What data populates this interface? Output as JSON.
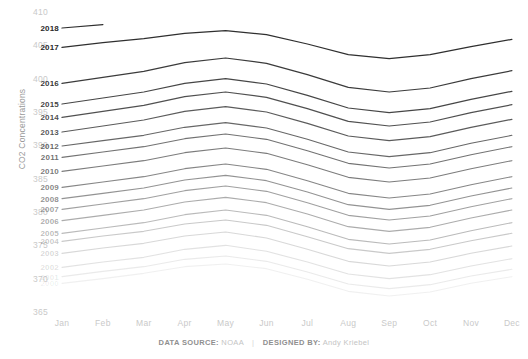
{
  "chart_data": {
    "type": "line",
    "title": "",
    "subtitle": "",
    "xlabel": "",
    "ylabel": "CO2 Concentrations",
    "grid": false,
    "legend_position": "inline-left-labels",
    "ylim": [
      365,
      410
    ],
    "y_ticks": [
      410,
      405,
      400,
      395,
      390,
      385,
      380,
      375,
      370,
      365
    ],
    "categories": [
      "Jan",
      "Feb",
      "Mar",
      "Apr",
      "May",
      "Jun",
      "Jul",
      "Aug",
      "Sep",
      "Oct",
      "Nov",
      "Dec"
    ],
    "x": [
      "Jan",
      "Feb",
      "Mar",
      "Apr",
      "May",
      "Jun",
      "Jul",
      "Aug",
      "Sep",
      "Oct",
      "Nov",
      "Dec"
    ],
    "series": [
      {
        "name": "2000",
        "opacity": 0.07,
        "values": [
          369.3,
          370.0,
          370.8,
          371.8,
          372.2,
          371.5,
          369.9,
          368.1,
          367.4,
          368.0,
          369.3,
          370.3
        ]
      },
      {
        "name": "2001",
        "opacity": 0.1,
        "values": [
          370.3,
          371.1,
          371.8,
          372.9,
          373.4,
          372.6,
          371.0,
          369.2,
          368.5,
          369.1,
          370.4,
          371.4
        ]
      },
      {
        "name": "2002",
        "opacity": 0.14,
        "values": [
          371.7,
          372.5,
          373.2,
          374.4,
          375.0,
          374.1,
          372.5,
          370.7,
          370.0,
          370.6,
          371.9,
          373.0
        ]
      },
      {
        "name": "2003",
        "opacity": 0.19,
        "values": [
          373.8,
          374.6,
          375.3,
          376.4,
          377.0,
          376.1,
          374.4,
          372.6,
          371.9,
          372.5,
          373.8,
          374.9
        ]
      },
      {
        "name": "2004",
        "opacity": 0.26,
        "values": [
          375.6,
          376.4,
          377.1,
          378.2,
          378.8,
          378.0,
          376.3,
          374.5,
          373.8,
          374.4,
          375.7,
          376.8
        ]
      },
      {
        "name": "2005",
        "opacity": 0.33,
        "values": [
          376.8,
          377.6,
          378.4,
          379.6,
          380.3,
          379.5,
          377.8,
          375.9,
          375.2,
          375.8,
          377.2,
          378.4
        ]
      },
      {
        "name": "2006",
        "opacity": 0.4,
        "values": [
          378.7,
          379.5,
          380.3,
          381.5,
          382.2,
          381.4,
          379.7,
          377.8,
          377.1,
          377.7,
          379.1,
          380.3
        ]
      },
      {
        "name": "2007",
        "opacity": 0.46,
        "values": [
          380.4,
          381.2,
          382.0,
          383.2,
          383.9,
          383.1,
          381.4,
          379.5,
          378.8,
          379.4,
          380.8,
          382.0
        ]
      },
      {
        "name": "2008",
        "opacity": 0.52,
        "values": [
          382.0,
          382.8,
          383.6,
          384.8,
          385.5,
          384.7,
          383.0,
          381.1,
          380.4,
          381.0,
          382.4,
          383.6
        ]
      },
      {
        "name": "2009",
        "opacity": 0.58,
        "values": [
          383.7,
          384.5,
          385.3,
          386.5,
          387.2,
          386.4,
          384.7,
          382.8,
          382.1,
          382.7,
          384.1,
          385.3
        ]
      },
      {
        "name": "2010",
        "opacity": 0.63,
        "values": [
          386.1,
          386.9,
          387.7,
          388.9,
          389.6,
          388.8,
          387.1,
          385.2,
          384.5,
          385.1,
          386.5,
          387.7
        ]
      },
      {
        "name": "2011",
        "opacity": 0.68,
        "values": [
          388.2,
          389.0,
          389.8,
          391.0,
          391.7,
          390.9,
          389.2,
          387.3,
          386.6,
          387.2,
          388.6,
          389.8
        ]
      },
      {
        "name": "2012",
        "opacity": 0.73,
        "values": [
          389.9,
          390.7,
          391.5,
          392.7,
          393.4,
          392.6,
          390.9,
          389.0,
          388.3,
          388.9,
          390.3,
          391.5
        ]
      },
      {
        "name": "2013",
        "opacity": 0.79,
        "values": [
          392.0,
          392.9,
          393.8,
          395.1,
          395.8,
          395.0,
          393.3,
          391.4,
          390.7,
          391.3,
          392.7,
          393.9
        ]
      },
      {
        "name": "2014",
        "opacity": 0.84,
        "values": [
          394.2,
          395.1,
          396.0,
          397.3,
          398.0,
          397.2,
          395.5,
          393.6,
          392.9,
          393.5,
          394.9,
          396.1
        ]
      },
      {
        "name": "2015",
        "opacity": 0.89,
        "values": [
          396.2,
          397.1,
          398.0,
          399.3,
          400.0,
          399.2,
          397.5,
          395.6,
          394.9,
          395.5,
          396.9,
          398.1
        ]
      },
      {
        "name": "2016",
        "opacity": 0.94,
        "values": [
          399.3,
          400.2,
          401.1,
          402.4,
          403.1,
          402.3,
          400.6,
          398.7,
          398.0,
          398.6,
          400.0,
          401.2
        ]
      },
      {
        "name": "2017",
        "opacity": 1.0,
        "values": [
          404.7,
          405.4,
          406.0,
          406.8,
          407.2,
          406.6,
          405.2,
          403.6,
          403.0,
          403.6,
          404.8,
          405.9
        ]
      },
      {
        "name": "2018",
        "opacity": 1.0,
        "values": [
          407.6,
          408.1,
          null,
          null,
          null,
          null,
          null,
          null,
          null,
          null,
          null,
          null
        ]
      }
    ]
  },
  "footer": {
    "source_label": "DATA SOURCE:",
    "source_value": "NOAA",
    "separator": "|",
    "designer_label": "DESIGNED BY:",
    "designer_value": "Andy Kriebel"
  },
  "colors": {
    "line": "#2f2f2f",
    "tick": "#c9c9c9",
    "axis_title": "#9a9a9a",
    "background": "#ffffff"
  }
}
